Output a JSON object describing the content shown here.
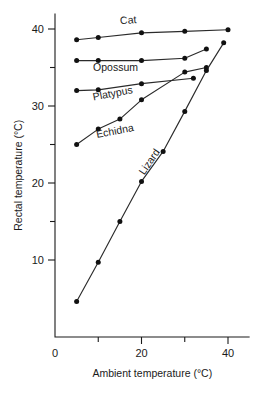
{
  "chart_data": {
    "type": "line",
    "title": "",
    "subtitle": "",
    "xlabel": "Ambient temperature (°C)",
    "ylabel": "Rectal temperature (°C)",
    "xlim": [
      0,
      45
    ],
    "ylim": [
      0,
      42
    ],
    "grid": false,
    "legend_position": "inline-labels",
    "x_ticks": [
      0,
      10,
      20,
      30,
      40
    ],
    "x_tick_labels": [
      "0",
      "",
      "20",
      "",
      "40"
    ],
    "y_ticks": [
      10,
      15,
      20,
      25,
      30,
      35,
      40
    ],
    "y_tick_labels": [
      "10",
      "",
      "20",
      "",
      "30",
      "",
      "40"
    ],
    "series": [
      {
        "name": "Cat",
        "label": "Cat",
        "label_x": 17,
        "label_y": 40.7,
        "label_rotation": -5,
        "x": [
          5,
          10,
          20,
          30,
          40
        ],
        "y": [
          38.6,
          38.9,
          39.5,
          39.7,
          39.9
        ]
      },
      {
        "name": "Opossum",
        "label": "Opossum",
        "label_x": 14,
        "label_y": 34.6,
        "label_rotation": 0,
        "x": [
          5,
          10,
          20,
          30,
          35
        ],
        "y": [
          35.9,
          35.9,
          35.9,
          36.2,
          37.4
        ]
      },
      {
        "name": "Platypus",
        "label": "Platypus",
        "label_x": 13.5,
        "label_y": 31.2,
        "label_rotation": -11,
        "x": [
          5,
          10,
          20,
          32
        ],
        "y": [
          32.0,
          32.1,
          32.9,
          33.6
        ]
      },
      {
        "name": "Echidna",
        "label": "Echidna",
        "label_x": 14,
        "label_y": 26.3,
        "label_rotation": -11,
        "x": [
          5,
          10,
          15,
          20,
          30,
          35
        ],
        "y": [
          25.0,
          27.0,
          28.3,
          30.8,
          34.4,
          35.0
        ]
      },
      {
        "name": "Lizard",
        "label": "Lizard",
        "label_x": 22.5,
        "label_y": 22.5,
        "label_rotation": -56,
        "x": [
          5,
          10,
          15,
          20,
          25,
          30,
          35,
          39
        ],
        "y": [
          4.6,
          9.7,
          15.0,
          20.2,
          24.1,
          29.3,
          34.6,
          38.2
        ]
      }
    ]
  },
  "axes": {
    "x_axis_label": "Ambient temperature (°C)",
    "y_axis_label": "Rectal temperature (°C)"
  }
}
